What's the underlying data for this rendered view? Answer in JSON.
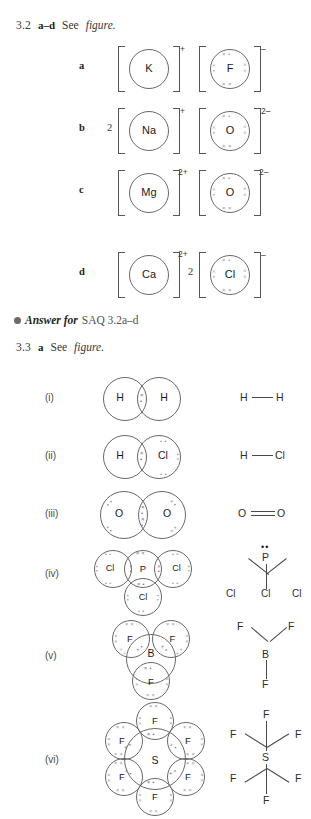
{
  "page": {
    "width": 311,
    "height": 819,
    "background": "#ffffff",
    "ink": "#231f20",
    "electron_color": "#97949a"
  },
  "q32": {
    "number": "3.2",
    "parts": "a–d",
    "see": "See",
    "figure": "figure.",
    "rows": [
      {
        "letter": "a",
        "cation": {
          "multiplier": "",
          "symbol": "K",
          "charge": "+",
          "electrons": 0
        },
        "anion": {
          "multiplier": "",
          "symbol": "F",
          "charge": "–",
          "electrons": 8
        }
      },
      {
        "letter": "b",
        "cation": {
          "multiplier": "2",
          "symbol": "Na",
          "charge": "+",
          "electrons": 0
        },
        "anion": {
          "multiplier": "",
          "symbol": "O",
          "charge": "2–",
          "electrons": 8
        }
      },
      {
        "letter": "c",
        "cation": {
          "multiplier": "",
          "symbol": "Mg",
          "charge": "2+",
          "electrons": 0
        },
        "anion": {
          "multiplier": "",
          "symbol": "O",
          "charge": "2–",
          "electrons": 8
        }
      },
      {
        "letter": "d",
        "cation": {
          "multiplier": "",
          "symbol": "Ca",
          "charge": "2+",
          "electrons": 0
        },
        "anion": {
          "multiplier": "2",
          "symbol": "Cl",
          "charge": "–",
          "electrons": 8
        }
      }
    ]
  },
  "answer_note": {
    "bullet": "bullet-icon",
    "lead": "Answer for",
    "tail": "SAQ 3.2a–d"
  },
  "q33": {
    "number": "3.3",
    "part": "a",
    "see": "See",
    "figure": "figure."
  },
  "molecules": [
    {
      "roman": "(i)",
      "name": "hydrogen",
      "dot_cross": {
        "atoms": [
          "H",
          "H"
        ],
        "shared_pairs": 1
      },
      "structural": {
        "atoms": [
          "H",
          "H"
        ],
        "bond": "single",
        "label": "H — H"
      }
    },
    {
      "roman": "(ii)",
      "name": "hydrogen chloride",
      "dot_cross": {
        "atoms": [
          "H",
          "Cl"
        ],
        "shared_pairs": 1
      },
      "structural": {
        "atoms": [
          "H",
          "Cl"
        ],
        "bond": "single",
        "label": "H — Cl"
      }
    },
    {
      "roman": "(iii)",
      "name": "oxygen",
      "dot_cross": {
        "atoms": [
          "O",
          "O"
        ],
        "shared_pairs": 2
      },
      "structural": {
        "atoms": [
          "O",
          "O"
        ],
        "bond": "double",
        "label": "O = O"
      }
    },
    {
      "roman": "(iv)",
      "name": "phosphorus trichloride",
      "dot_cross": {
        "central": "P",
        "outer": [
          "Cl",
          "Cl",
          "Cl"
        ],
        "shared_pairs": 3,
        "lone_pairs_central": 1
      },
      "structural": {
        "central": "P",
        "outer": [
          "Cl",
          "Cl",
          "Cl"
        ],
        "lone_pair": "••"
      }
    },
    {
      "roman": "(v)",
      "name": "boron trifluoride",
      "dot_cross": {
        "central": "B",
        "outer": [
          "F",
          "F",
          "F"
        ],
        "shared_pairs": 3,
        "lone_pairs_central": 0
      },
      "structural": {
        "central": "B",
        "outer": [
          "F",
          "F",
          "F"
        ]
      }
    },
    {
      "roman": "(vi)",
      "name": "sulfur hexafluoride",
      "dot_cross": {
        "central": "S",
        "outer": [
          "F",
          "F",
          "F",
          "F",
          "F",
          "F"
        ],
        "shared_pairs": 6,
        "lone_pairs_central": 0
      },
      "structural": {
        "central": "S",
        "outer": [
          "F",
          "F",
          "F",
          "F",
          "F",
          "F"
        ]
      }
    }
  ],
  "glyphs": {
    "cross": "×",
    "dot": "•",
    "pair_xd": "× •",
    "pair_xx": "× ×",
    "pair_dd": "• •"
  }
}
